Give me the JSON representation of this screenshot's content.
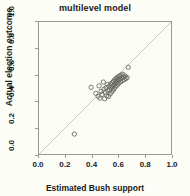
{
  "chart_data": {
    "type": "scatter",
    "title": "multilevel model",
    "xlabel": "Estimated Bush support",
    "ylabel": "Actual election outcome",
    "xlim": [
      0.0,
      1.0
    ],
    "ylim": [
      0.0,
      1.0
    ],
    "xticks": [
      "0.0",
      "0.2",
      "0.4",
      "0.6",
      "0.8",
      "1.0"
    ],
    "yticks": [
      "0.0",
      "0.2",
      "0.4",
      "0.6",
      "0.8",
      "1.0"
    ],
    "xtick_values": [
      0.0,
      0.2,
      0.4,
      0.6,
      0.8,
      1.0
    ],
    "ytick_values": [
      0.0,
      0.2,
      0.4,
      0.6,
      0.8,
      1.0
    ],
    "grid": false,
    "legend": "none",
    "marker": "open-circle",
    "marker_color": "#6b6b63",
    "reference_line": {
      "name": "y = x identity line",
      "from": [
        0.0,
        0.0
      ],
      "to": [
        1.0,
        1.0
      ],
      "color": "#c8c8bc"
    },
    "series": [
      {
        "name": "states",
        "points": [
          [
            0.268,
            0.151
          ],
          [
            0.395,
            0.505
          ],
          [
            0.43,
            0.46
          ],
          [
            0.448,
            0.437
          ],
          [
            0.455,
            0.516
          ],
          [
            0.462,
            0.423
          ],
          [
            0.47,
            0.474
          ],
          [
            0.478,
            0.452
          ],
          [
            0.487,
            0.545
          ],
          [
            0.492,
            0.491
          ],
          [
            0.497,
            0.419
          ],
          [
            0.503,
            0.466
          ],
          [
            0.508,
            0.503
          ],
          [
            0.513,
            0.441
          ],
          [
            0.518,
            0.527
          ],
          [
            0.522,
            0.478
          ],
          [
            0.527,
            0.436
          ],
          [
            0.531,
            0.512
          ],
          [
            0.535,
            0.487
          ],
          [
            0.539,
            0.455
          ],
          [
            0.543,
            0.53
          ],
          [
            0.547,
            0.499
          ],
          [
            0.551,
            0.47
          ],
          [
            0.555,
            0.541
          ],
          [
            0.558,
            0.512
          ],
          [
            0.561,
            0.484
          ],
          [
            0.564,
            0.551
          ],
          [
            0.567,
            0.523
          ],
          [
            0.57,
            0.496
          ],
          [
            0.573,
            0.561
          ],
          [
            0.576,
            0.534
          ],
          [
            0.579,
            0.508
          ],
          [
            0.582,
            0.57
          ],
          [
            0.585,
            0.545
          ],
          [
            0.588,
            0.519
          ],
          [
            0.591,
            0.578
          ],
          [
            0.594,
            0.554
          ],
          [
            0.597,
            0.529
          ],
          [
            0.601,
            0.585
          ],
          [
            0.604,
            0.562
          ],
          [
            0.607,
            0.538
          ],
          [
            0.611,
            0.592
          ],
          [
            0.614,
            0.57
          ],
          [
            0.618,
            0.547
          ],
          [
            0.622,
            0.598
          ],
          [
            0.626,
            0.577
          ],
          [
            0.63,
            0.556
          ],
          [
            0.635,
            0.604
          ],
          [
            0.64,
            0.583
          ],
          [
            0.646,
            0.563
          ],
          [
            0.652,
            0.591
          ],
          [
            0.659,
            0.572
          ],
          [
            0.667,
            0.58
          ],
          [
            0.676,
            0.657
          ]
        ]
      }
    ]
  }
}
